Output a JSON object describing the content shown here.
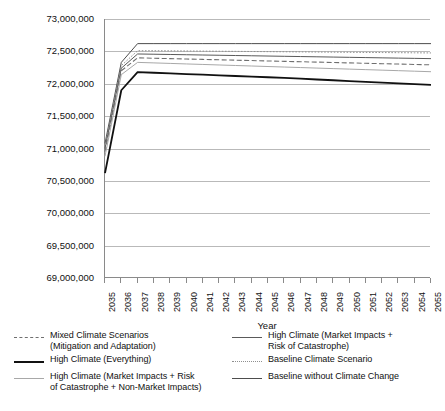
{
  "chart_data": {
    "type": "line",
    "title": "",
    "xlabel": "Year",
    "ylabel": "Annual Revenue (US$)",
    "ylim": [
      69000000,
      73000000
    ],
    "ytick_labels": [
      "73,000,000",
      "72,500,000",
      "72,000,000",
      "71,500,000",
      "71,000,000",
      "70,500,000",
      "70,000,000",
      "69,500,000",
      "69,000,000"
    ],
    "ytick_values": [
      73000000,
      72500000,
      72000000,
      71500000,
      71000000,
      70500000,
      70000000,
      69500000,
      69000000
    ],
    "grid": true,
    "legend_position": "below",
    "x": [
      2035,
      2036,
      2037,
      2038,
      2039,
      2040,
      2041,
      2042,
      2043,
      2044,
      2045,
      2046,
      2047,
      2048,
      2049,
      2050,
      2051,
      2052,
      2053,
      2054,
      2055
    ],
    "categories": [
      "2035",
      "2036",
      "2037",
      "2038",
      "2039",
      "2040",
      "2041",
      "2042",
      "2043",
      "2044",
      "2045",
      "2046",
      "2047",
      "2048",
      "2049",
      "2050",
      "2051",
      "2052",
      "2053",
      "2054",
      "2055"
    ],
    "series": [
      {
        "name": "Baseline without Climate Change",
        "style": "solid",
        "color": "#4d4d4d",
        "width": 1.0,
        "values": [
          71080000,
          72330000,
          72620000,
          72620000,
          72620000,
          72620000,
          72620000,
          72620000,
          72620000,
          72620000,
          72620000,
          72620000,
          72620000,
          72620000,
          72620000,
          72620000,
          72620000,
          72620000,
          72620000,
          72620000,
          72620000
        ]
      },
      {
        "name": "Baseline Climate Scenario",
        "style": "dotted",
        "color": "#8f8f8f",
        "width": 1.0,
        "values": [
          71030000,
          72280000,
          72510000,
          72510000,
          72508000,
          72506000,
          72504000,
          72502000,
          72500000,
          72498000,
          72496000,
          72494000,
          72492000,
          72490000,
          72488000,
          72486000,
          72484000,
          72482000,
          72480000,
          72478000,
          72476000
        ]
      },
      {
        "name": "High Climate (Market Impacts + Risk of Catastrophe)",
        "style": "solid",
        "color": "#5a5a5a",
        "width": 1.0,
        "values": [
          71000000,
          72240000,
          72460000,
          72456000,
          72452000,
          72448000,
          72444000,
          72440000,
          72436000,
          72432000,
          72428000,
          72424000,
          72420000,
          72416000,
          72412000,
          72408000,
          72404000,
          72400000,
          72396000,
          72392000,
          72388000
        ]
      },
      {
        "name": "Mixed Climate Scenarios (Mitigation and Adaptation)",
        "style": "dashed",
        "color": "#6f6f6f",
        "width": 1.1,
        "values": [
          70950000,
          72200000,
          72400000,
          72394000,
          72388000,
          72382000,
          72376000,
          72370000,
          72364000,
          72358000,
          72352000,
          72346000,
          72340000,
          72334000,
          72328000,
          72322000,
          72316000,
          72310000,
          72304000,
          72298000,
          72292000
        ]
      },
      {
        "name": "High Climate (Market Impacts + Risk of Catastrophe + Non-Market Impacts)",
        "style": "solid",
        "color": "#a8a8a8",
        "width": 1.0,
        "values": [
          70880000,
          72140000,
          72330000,
          72322000,
          72314000,
          72306000,
          72298000,
          72290000,
          72282000,
          72274000,
          72266000,
          72258000,
          72250000,
          72242000,
          72234000,
          72226000,
          72218000,
          72210000,
          72202000,
          72194000,
          72186000
        ]
      },
      {
        "name": "High Climate (Everything)",
        "style": "solid",
        "color": "#111111",
        "width": 1.8,
        "values": [
          70620000,
          71900000,
          72180000,
          72170000,
          72160000,
          72150000,
          72140000,
          72130000,
          72120000,
          72110000,
          72100000,
          72090000,
          72078000,
          72066000,
          72054000,
          72042000,
          72030000,
          72018000,
          72006000,
          71994000,
          71982000
        ]
      }
    ]
  },
  "legend": {
    "left_column": [
      {
        "label": "Mixed Climate Scenarios (Mitigation and Adaptation)",
        "line1": "Mixed Climate Scenarios",
        "line2": "(Mitigation and Adaptation)",
        "style": "dashed",
        "color": "#6f6f6f",
        "width": "1.1px"
      },
      {
        "label": "High Climate (Everything)",
        "line1": "High Climate (Everything)",
        "line2": "",
        "style": "solid",
        "color": "#111111",
        "width": "2px"
      },
      {
        "label": "High Climate (Market Impacts + Risk of Catastrophe + Non-Market Impacts)",
        "line1": "High Climate (Market Impacts + Risk",
        "line2": "of Catastrophe + Non-Market Impacts)",
        "style": "solid",
        "color": "#a8a8a8",
        "width": "1px"
      }
    ],
    "right_column": [
      {
        "label": "High Climate (Market Impacts + Risk of Catastrophe)",
        "line1": "High Climate (Market Impacts +",
        "line2": "Risk of Catastrophe)",
        "style": "solid",
        "color": "#5a5a5a",
        "width": "1px"
      },
      {
        "label": "Baseline Climate Scenario",
        "line1": "Baseline Climate Scenario",
        "line2": "",
        "style": "dotted",
        "color": "#8f8f8f",
        "width": "1px"
      },
      {
        "label": "Baseline without Climate Change",
        "line1": "Baseline without Climate Change",
        "line2": "",
        "style": "solid",
        "color": "#4d4d4d",
        "width": "1px"
      }
    ]
  },
  "colors": {
    "grid": "#b9b9b9",
    "axis": "#8a8a8a",
    "text": "#111111",
    "background": "#ffffff"
  }
}
